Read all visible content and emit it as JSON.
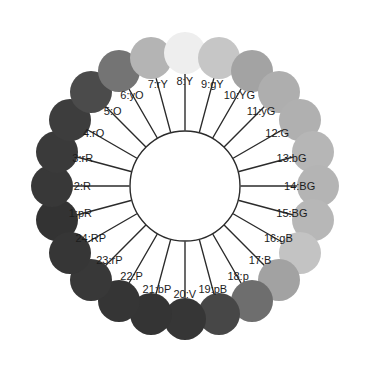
{
  "diagram": {
    "kind": "munsell-hue-circle",
    "type": "color-wheel",
    "background_color": "#ffffff",
    "line_color": "#2b2b2b",
    "label_color": "#1c1c1c",
    "inner_circle": {
      "center_x": 185,
      "center_y": 186,
      "radius": 55,
      "fill": "#ffffff",
      "stroke": "#2b2b2b",
      "stroke_width": 1.4
    },
    "geometry": {
      "segment_count": 24,
      "top_position_index": 8,
      "direction": "clockwise",
      "tick_inner_radius": 56,
      "tick_outer_radius": 112,
      "swatch_radius": 133,
      "swatch_diameter": 42,
      "label_radius": 100
    },
    "hues": [
      {
        "index": 1,
        "code": "pR",
        "label": "1:pR",
        "color": "#333333"
      },
      {
        "index": 2,
        "code": "R",
        "label": "2:R",
        "color": "#383838"
      },
      {
        "index": 3,
        "code": "rR",
        "label": "3:rR",
        "color": "#3a3a3a"
      },
      {
        "index": 4,
        "code": "rO",
        "label": "4:rO",
        "color": "#3d3d3d"
      },
      {
        "index": 5,
        "code": "O",
        "label": "5:O",
        "color": "#4b4b4b"
      },
      {
        "index": 6,
        "code": "yO",
        "label": "6:yO",
        "color": "#747474"
      },
      {
        "index": 7,
        "code": "rY",
        "label": "7:rY",
        "color": "#b4b4b4"
      },
      {
        "index": 8,
        "code": "Y",
        "label": "8:Y",
        "color": "#eeeeee"
      },
      {
        "index": 9,
        "code": "gY",
        "label": "9:gY",
        "color": "#c6c6c6"
      },
      {
        "index": 10,
        "code": "YG",
        "label": "10:YG",
        "color": "#a3a3a3"
      },
      {
        "index": 11,
        "code": "yG",
        "label": "11:yG",
        "color": "#aeaeae"
      },
      {
        "index": 12,
        "code": "G",
        "label": "12:G",
        "color": "#b0b0b0"
      },
      {
        "index": 13,
        "code": "bG",
        "label": "13:bG",
        "color": "#b6b6b6"
      },
      {
        "index": 14,
        "code": "BG",
        "label": "14:BG",
        "color": "#b4b4b4"
      },
      {
        "index": 15,
        "code": "BG",
        "label": "15:BG",
        "color": "#b7b7b7"
      },
      {
        "index": 16,
        "code": "gB",
        "label": "16:gB",
        "color": "#c3c3c3"
      },
      {
        "index": 17,
        "code": "B",
        "label": "17:B",
        "color": "#a2a2a2"
      },
      {
        "index": 18,
        "code": "p",
        "label": "18:p",
        "color": "#6e6e6e"
      },
      {
        "index": 19,
        "code": "pB",
        "label": "19:pB",
        "color": "#474747"
      },
      {
        "index": 20,
        "code": "V",
        "label": "20:V",
        "color": "#363636"
      },
      {
        "index": 21,
        "code": "bP",
        "label": "21:bP",
        "color": "#343434"
      },
      {
        "index": 22,
        "code": "P",
        "label": "22:P",
        "color": "#353535"
      },
      {
        "index": 23,
        "code": "rP",
        "label": "23:rP",
        "color": "#383838"
      },
      {
        "index": 24,
        "code": "RP",
        "label": "24:RP",
        "color": "#363636"
      }
    ],
    "label_offsets": [
      {
        "index": 1,
        "dx": -2,
        "dy": 0
      },
      {
        "index": 2,
        "dx": 2,
        "dy": 0
      },
      {
        "index": 3,
        "dx": 0,
        "dy": 0
      },
      {
        "index": 4,
        "dx": 0,
        "dy": 0
      },
      {
        "index": 5,
        "dx": 2,
        "dy": 0
      },
      {
        "index": 6,
        "dx": 0,
        "dy": 0
      },
      {
        "index": 7,
        "dx": 0,
        "dy": 0
      },
      {
        "index": 8,
        "dx": 0,
        "dy": 0
      },
      {
        "index": 9,
        "dx": 0,
        "dy": 0
      },
      {
        "index": 10,
        "dx": 0,
        "dy": 0
      },
      {
        "index": 11,
        "dx": 0,
        "dy": 0
      },
      {
        "index": 12,
        "dx": 0,
        "dy": 0
      },
      {
        "index": 13,
        "dx": 2,
        "dy": 0
      },
      {
        "index": 14,
        "dx": 6,
        "dy": 0
      },
      {
        "index": 15,
        "dx": 2,
        "dy": 0
      },
      {
        "index": 16,
        "dx": 0,
        "dy": 0
      },
      {
        "index": 17,
        "dx": 0,
        "dy": 0
      },
      {
        "index": 18,
        "dx": 0,
        "dy": 0
      },
      {
        "index": 19,
        "dx": 0,
        "dy": 2
      },
      {
        "index": 20,
        "dx": 0,
        "dy": 4
      },
      {
        "index": 21,
        "dx": 0,
        "dy": 2
      },
      {
        "index": 22,
        "dx": 0,
        "dy": 0
      },
      {
        "index": 23,
        "dx": 0,
        "dy": 0
      },
      {
        "index": 24,
        "dx": 0,
        "dy": 0
      }
    ]
  }
}
